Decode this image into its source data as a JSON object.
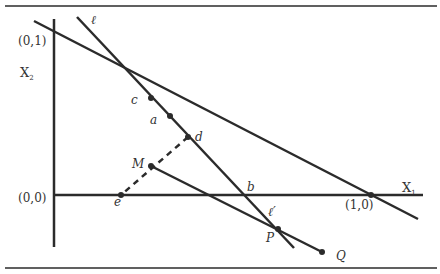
{
  "diagram": {
    "colors": {
      "line": "#2b2b2b",
      "text": "#333333",
      "background": "#ffffff"
    },
    "axes": {
      "x_label": "X",
      "x_sub": "1",
      "y_label": "X",
      "y_sub": "2"
    },
    "coordinates": {
      "origin": "(0,0)",
      "y_unit": "(0,1)",
      "x_unit": "(1,0)"
    },
    "lines": {
      "ell": "ℓ",
      "ell_prime": "ℓ′"
    },
    "points": {
      "c": "c",
      "a": "a",
      "d": "d",
      "M": "M",
      "e": "e",
      "b": "b",
      "P": "P",
      "Q": "Q"
    }
  }
}
